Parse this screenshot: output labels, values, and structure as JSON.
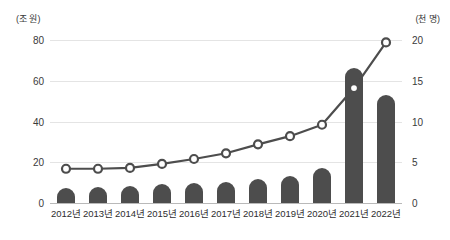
{
  "chart_data": {
    "type": "bar",
    "title": "",
    "subtitle": "",
    "xlabel": "",
    "ylabel": "(조 원)",
    "y2label": "(천 명)",
    "grid": true,
    "legend": "none",
    "categories": [
      "2012년",
      "2013년",
      "2014년",
      "2015년",
      "2016년",
      "2017년",
      "2018년",
      "2019년",
      "2020년",
      "2021년",
      "2022년"
    ],
    "ylim": [
      0,
      80
    ],
    "yticks": [
      0,
      20,
      40,
      60,
      80
    ],
    "y2lim": [
      0,
      20
    ],
    "y2ticks": [
      0,
      5,
      10,
      15,
      20
    ],
    "series": [
      {
        "name": "금액",
        "type": "bar",
        "axis": "left",
        "unit": "조 원",
        "color": "#4d4d4d",
        "values": [
          7.5,
          8,
          8.5,
          9.5,
          10,
          10.5,
          12,
          13.5,
          17,
          66.5,
          53
        ]
      },
      {
        "name": "인원",
        "type": "line",
        "axis": "right",
        "unit": "천 명",
        "color": "#4d4d4d",
        "marker": "circle-open",
        "values": [
          4.2,
          4.2,
          4.3,
          4.8,
          5.4,
          6.1,
          7.2,
          8.2,
          9.6,
          14.1,
          19.7
        ]
      }
    ]
  }
}
